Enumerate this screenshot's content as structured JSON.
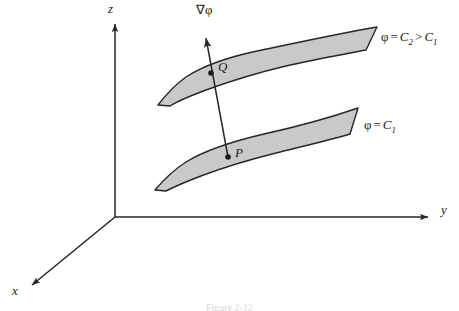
{
  "figure": {
    "kind": "3d-level-surface-gradient-diagram",
    "background_color": "#ffffff",
    "stroke_color": "#262626",
    "surface_fill_color": "#c9c9c9",
    "width": 459,
    "height": 311
  },
  "axes": {
    "z": {
      "label": "z",
      "label_x": 110,
      "label_y": 3,
      "arrow": "up"
    },
    "y": {
      "label": "y",
      "label_x": 443,
      "label_y": 210,
      "arrow": "right"
    },
    "x": {
      "label": "x",
      "label_x": 13,
      "label_y": 288,
      "arrow": "down-left"
    },
    "origin_x": 115,
    "origin_y": 217
  },
  "gradient_vector": {
    "label": "∇φ",
    "label_x": 198,
    "label_y": 3,
    "tail_point": "P",
    "head_direction": "up",
    "arrow_tip_x": 208,
    "arrow_tip_y": 31
  },
  "points": [
    {
      "name": "Q",
      "label": "Q",
      "marker_x": 211,
      "marker_y": 73,
      "label_x": 218,
      "label_y": 63
    },
    {
      "name": "P",
      "label": "P",
      "marker_x": 228,
      "marker_y": 157,
      "label_x": 235,
      "label_y": 149
    }
  ],
  "surfaces": [
    {
      "id": "upper",
      "label_text": "φ = C2 > C1",
      "label_phi": "φ",
      "label_equals": "=",
      "label_c2": "C",
      "label_c2_sub": "2",
      "label_gt": ">",
      "label_c1": "C",
      "label_c1_sub": "1",
      "label_x": 382,
      "label_y": 35,
      "constant": "C2"
    },
    {
      "id": "lower",
      "label_text": "φ = C1",
      "label_phi": "φ",
      "label_equals": "=",
      "label_c1": "C",
      "label_c1_sub": "1",
      "label_x": 365,
      "label_y": 123,
      "constant": "C1"
    }
  ],
  "caption": {
    "text": "Figure 2-12"
  }
}
